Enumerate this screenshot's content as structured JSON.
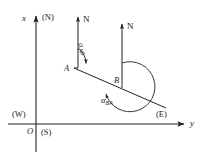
{
  "figure": {
    "type": "bearing-diagram",
    "stroke_color": "#222222",
    "background_color": "#ffffff"
  },
  "axes": {
    "vertical": {
      "variable": "x",
      "direction_label": "(N)",
      "arrow": "up"
    },
    "horizontal": {
      "variable": "y",
      "direction_label": "(E)",
      "arrow": "right"
    },
    "origin_label": "O",
    "quadrant_labels": {
      "north": "(N)",
      "south": "(S)",
      "east": "(E)",
      "west": "(W)"
    }
  },
  "north_arrows": [
    {
      "id": "north-at-a",
      "label": "N"
    },
    {
      "id": "north-at-b",
      "label": "N"
    }
  ],
  "stations": [
    {
      "id": "station-a",
      "label": "A"
    },
    {
      "id": "station-b",
      "label": "B"
    }
  ],
  "angles": [
    {
      "id": "alpha-ab",
      "symbol": "α",
      "subscript": "AB",
      "kind": "forward-bearing",
      "vertex": "A"
    },
    {
      "id": "alpha-ba",
      "symbol": "α",
      "subscript": "BA",
      "kind": "back-bearing",
      "vertex": "B"
    }
  ]
}
